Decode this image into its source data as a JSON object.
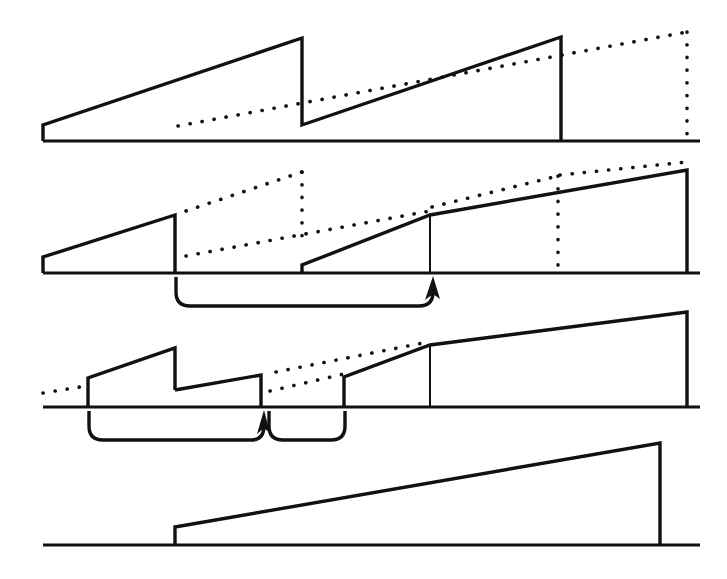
{
  "figure": {
    "background_color": "#ffffff",
    "ink_color": "#111111",
    "width": 727,
    "height": 579,
    "panel_count": 4
  },
  "chart_data": {
    "type": "line",
    "subtitle": "",
    "xlabel": "",
    "ylabel": "",
    "grid": false,
    "legend": "none",
    "xlim": [
      0,
      727
    ],
    "ylim": [
      579,
      0
    ],
    "axis_style": "single horizontal baseline per panel, no tick labels",
    "panels": [
      {
        "name": "panel-1",
        "baseline_y": 141,
        "baseline_x_start": 43,
        "baseline_x_end": 700,
        "series": [
          {
            "name": "solid-sawtooth-1",
            "style": "solid",
            "points": [
              [
                43,
                125
              ],
              [
                43,
                140
              ],
              [
                43,
                125
              ],
              [
                302,
                38
              ],
              [
                302,
                125
              ],
              [
                561,
                37
              ],
              [
                561,
                141
              ]
            ]
          },
          {
            "name": "dotted-ramp-1",
            "style": "dotted",
            "points": [
              [
                178,
                126
              ],
              [
                687,
                32
              ]
            ]
          },
          {
            "name": "dotted-drop-1",
            "style": "dotted",
            "points": [
              [
                687,
                32
              ],
              [
                687,
                134
              ]
            ]
          }
        ]
      },
      {
        "name": "panel-2",
        "baseline_y": 273,
        "baseline_x_start": 43,
        "baseline_x_end": 700,
        "series": [
          {
            "name": "solid-sawtooth-2a",
            "style": "solid",
            "points": [
              [
                43,
                257
              ],
              [
                43,
                272
              ],
              [
                43,
                257
              ],
              [
                175,
                215
              ],
              [
                175,
                272
              ]
            ]
          },
          {
            "name": "solid-sawtooth-2b",
            "style": "solid",
            "points": [
              [
                302,
                265
              ],
              [
                302,
                272
              ],
              [
                302,
                265
              ],
              [
                430,
                215
              ],
              [
                687,
                170
              ],
              [
                687,
                272
              ]
            ]
          },
          {
            "name": "thin-marker-2",
            "style": "solid-thin",
            "points": [
              [
                430,
                216
              ],
              [
                430,
                272
              ]
            ]
          },
          {
            "name": "dotted-upper-2",
            "style": "dotted",
            "points": [
              [
                186,
                211
              ],
              [
                302,
                172
              ]
            ]
          },
          {
            "name": "dotted-vertical-2",
            "style": "dotted",
            "points": [
              [
                302,
                172
              ],
              [
                302,
                246
              ]
            ]
          },
          {
            "name": "dotted-lower-2",
            "style": "dotted",
            "points": [
              [
                186,
                256
              ],
              [
                430,
                211
              ]
            ]
          },
          {
            "name": "dotted-upper-2b",
            "style": "dotted",
            "points": [
              [
                430,
                208
              ],
              [
                558,
                176
              ]
            ]
          },
          {
            "name": "dotted-vertical-2b",
            "style": "dotted",
            "points": [
              [
                558,
                176
              ],
              [
                558,
                265
              ]
            ]
          },
          {
            "name": "dotted-tail-2",
            "style": "dotted",
            "points": [
              [
                558,
                176
              ],
              [
                687,
                163
              ]
            ]
          }
        ],
        "annotation": {
          "type": "brace-with-arrow",
          "x_start": 175,
          "x_end": 433,
          "y_top": 276,
          "depth": 30,
          "arrow_at": "right-end",
          "arrow_direction": "up",
          "meaning": "interval mapped forward"
        }
      },
      {
        "name": "panel-3",
        "baseline_y": 407,
        "baseline_x_start": 43,
        "baseline_x_end": 700,
        "series": [
          {
            "name": "solid-sawtooth-3a",
            "style": "solid",
            "points": [
              [
                88,
                378
              ],
              [
                88,
                406
              ],
              [
                88,
                378
              ],
              [
                175,
                348
              ],
              [
                175,
                390
              ]
            ]
          },
          {
            "name": "solid-sawtooth-3b",
            "style": "solid",
            "points": [
              [
                175,
                390
              ],
              [
                261,
                375
              ],
              [
                261,
                406
              ]
            ]
          },
          {
            "name": "solid-sawtooth-3c",
            "style": "solid",
            "points": [
              [
                344,
                377
              ],
              [
                344,
                406
              ],
              [
                344,
                377
              ],
              [
                430,
                345
              ],
              [
                687,
                312
              ],
              [
                687,
                406
              ]
            ]
          },
          {
            "name": "thin-marker-3",
            "style": "solid-thin",
            "points": [
              [
                430,
                346
              ],
              [
                430,
                406
              ]
            ]
          },
          {
            "name": "dotted-left-3",
            "style": "dotted",
            "points": [
              [
                43,
                392
              ],
              [
                78,
                387
              ]
            ]
          },
          {
            "name": "dotted-upper-3",
            "style": "dotted",
            "points": [
              [
                275,
                372
              ],
              [
                430,
                342
              ]
            ]
          },
          {
            "name": "dotted-lower-3",
            "style": "dotted",
            "points": [
              [
                270,
                390
              ],
              [
                344,
                374
              ]
            ]
          }
        ],
        "annotations": [
          {
            "type": "brace-with-arrow",
            "x_start": 88,
            "x_end": 264,
            "y_top": 410,
            "depth": 30,
            "arrow_at": "right-end",
            "arrow_direction": "up",
            "meaning": "first compressed interval"
          },
          {
            "type": "brace",
            "x_start": 268,
            "x_end": 345,
            "y_top": 410,
            "depth": 30,
            "arrow_at": "none",
            "meaning": "second compressed interval"
          }
        ]
      },
      {
        "name": "panel-4",
        "baseline_y": 545,
        "baseline_x_start": 43,
        "baseline_x_end": 700,
        "series": [
          {
            "name": "solid-ramp-4",
            "style": "solid",
            "points": [
              [
                175,
                527
              ],
              [
                175,
                544
              ],
              [
                175,
                527
              ],
              [
                660,
                443
              ],
              [
                660,
                544
              ]
            ]
          }
        ]
      }
    ]
  }
}
